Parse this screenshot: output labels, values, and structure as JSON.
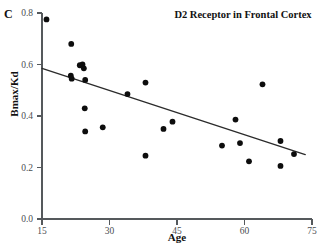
{
  "panel": {
    "label": "C"
  },
  "figure": {
    "title": "D2 Receptor in Frontal Cortex",
    "xlabel": "Age",
    "ylabel": "Bmax/Kd"
  },
  "colors": {
    "point": "#0d0d0d",
    "fit_line": "#2b2b2b",
    "axis": "#55595c",
    "tick_text": "#4a4e51",
    "background": "#ffffff"
  },
  "chart_data": {
    "type": "scatter",
    "title": "D2 Receptor in Frontal Cortex",
    "panel_label": "C",
    "xlabel": "Age",
    "ylabel": "Bmax/Kd",
    "xlim": [
      15,
      75
    ],
    "ylim": [
      0.0,
      0.8
    ],
    "xticks": [
      15,
      30,
      45,
      60,
      75
    ],
    "xtick_labels": [
      "15",
      "30",
      "45",
      "60",
      "75"
    ],
    "yticks": [
      0.0,
      0.2,
      0.4,
      0.6,
      0.8
    ],
    "ytick_labels": [
      "0.0",
      "0.2",
      "0.4",
      "0.6",
      "0.8"
    ],
    "grid": false,
    "legend": false,
    "series": [
      {
        "name": "D2 receptor binding",
        "marker": "filled-circle",
        "points": [
          {
            "x": 16.0,
            "y": 0.775
          },
          {
            "x": 21.5,
            "y": 0.68
          },
          {
            "x": 21.4,
            "y": 0.557
          },
          {
            "x": 21.6,
            "y": 0.545
          },
          {
            "x": 23.4,
            "y": 0.597
          },
          {
            "x": 24.0,
            "y": 0.6
          },
          {
            "x": 24.3,
            "y": 0.585
          },
          {
            "x": 24.6,
            "y": 0.54
          },
          {
            "x": 24.5,
            "y": 0.43
          },
          {
            "x": 24.6,
            "y": 0.34
          },
          {
            "x": 28.5,
            "y": 0.356
          },
          {
            "x": 34.0,
            "y": 0.485
          },
          {
            "x": 38.0,
            "y": 0.53
          },
          {
            "x": 38.0,
            "y": 0.246
          },
          {
            "x": 42.0,
            "y": 0.35
          },
          {
            "x": 44.0,
            "y": 0.378
          },
          {
            "x": 55.0,
            "y": 0.285
          },
          {
            "x": 58.0,
            "y": 0.386
          },
          {
            "x": 59.0,
            "y": 0.295
          },
          {
            "x": 61.0,
            "y": 0.224
          },
          {
            "x": 64.0,
            "y": 0.523
          },
          {
            "x": 68.0,
            "y": 0.303
          },
          {
            "x": 68.0,
            "y": 0.206
          },
          {
            "x": 71.0,
            "y": 0.252
          }
        ]
      }
    ],
    "fit_line": {
      "name": "linear regression",
      "x0": 15.0,
      "y0": 0.585,
      "x1": 73.5,
      "y1": 0.25
    }
  }
}
